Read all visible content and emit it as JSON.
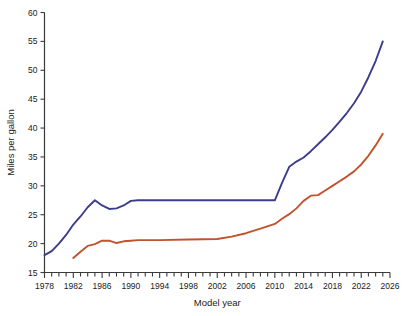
{
  "chart_data": {
    "type": "line",
    "title": "",
    "xlabel": "Model year",
    "ylabel": "Miles per gallon",
    "xlim": [
      1978,
      2026
    ],
    "ylim": [
      15,
      60
    ],
    "xticks": [
      1978,
      1982,
      1986,
      1990,
      1994,
      1998,
      2002,
      2006,
      2010,
      2014,
      2018,
      2022,
      2026
    ],
    "xtick_labels": [
      "1978",
      "1982",
      "1986",
      "1990",
      "1994",
      "1998",
      "2002",
      "2006",
      "2010",
      "2014",
      "2018",
      "2022",
      "2026"
    ],
    "xtick_minor_step": 1,
    "yticks": [
      15,
      20,
      25,
      30,
      35,
      40,
      45,
      50,
      55,
      60
    ],
    "ytick_labels": [
      "15",
      "20",
      "25",
      "30",
      "35",
      "40",
      "45",
      "50",
      "55",
      "60"
    ],
    "grid": false,
    "legend_position": "lower-right",
    "series": [
      {
        "name": "Cars",
        "color": "#3c3c8c",
        "x": [
          1978,
          1979,
          1980,
          1981,
          1982,
          1983,
          1984,
          1985,
          1986,
          1987,
          1988,
          1989,
          1990,
          1991,
          1992,
          1994,
          1998,
          2002,
          2006,
          2009,
          2010,
          2011,
          2012,
          2013,
          2014,
          2015,
          2016,
          2017,
          2018,
          2019,
          2020,
          2021,
          2022,
          2023,
          2024,
          2025
        ],
        "values": [
          18.0,
          18.7,
          20.0,
          21.5,
          23.3,
          24.7,
          26.3,
          27.5,
          26.6,
          26.0,
          26.1,
          26.6,
          27.4,
          27.5,
          27.5,
          27.5,
          27.5,
          27.5,
          27.5,
          27.5,
          27.5,
          30.5,
          33.3,
          34.2,
          34.9,
          36.0,
          37.2,
          38.4,
          39.7,
          41.1,
          42.6,
          44.3,
          46.3,
          48.8,
          51.6,
          55.0
        ]
      },
      {
        "name": "Trucks",
        "color": "#c0532f",
        "x": [
          1982,
          1983,
          1984,
          1985,
          1986,
          1987,
          1988,
          1989,
          1990,
          1991,
          1992,
          1994,
          1998,
          2002,
          2004,
          2006,
          2008,
          2010,
          2011,
          2012,
          2013,
          2014,
          2015,
          2016,
          2017,
          2018,
          2019,
          2020,
          2021,
          2022,
          2023,
          2024,
          2025
        ],
        "values": [
          17.5,
          18.6,
          19.6,
          19.9,
          20.5,
          20.5,
          20.1,
          20.4,
          20.5,
          20.6,
          20.6,
          20.6,
          20.7,
          20.8,
          21.2,
          21.8,
          22.6,
          23.4,
          24.3,
          25.1,
          26.1,
          27.4,
          28.3,
          28.4,
          29.2,
          30.0,
          30.8,
          31.6,
          32.5,
          33.7,
          35.2,
          37.0,
          39.0
        ]
      }
    ]
  },
  "legend": {
    "items": [
      {
        "label": "Cars",
        "color": "#3c3c8c"
      },
      {
        "label": "Trucks",
        "color": "#c0532f"
      }
    ]
  },
  "axes": {
    "y_title": "Miles per gallon",
    "x_title": "Model year"
  }
}
